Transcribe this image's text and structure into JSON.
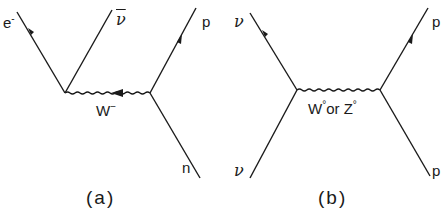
{
  "diagrams": [
    {
      "id": "a",
      "caption": "(a)",
      "particles": {
        "electron": "e",
        "electron_charge": "-",
        "antineutrino": "ν",
        "proton": "p",
        "neutron": "n"
      },
      "boson": {
        "label": "W",
        "charge": "−"
      }
    },
    {
      "id": "b",
      "caption": "(b)",
      "particles": {
        "neutrino_out": "ν",
        "neutrino_in": "ν",
        "proton_out": "p",
        "proton_in": "p"
      },
      "boson": {
        "label_w": "W",
        "sup_w": "°",
        "or": "or ",
        "label_z": "Z",
        "sup_z": "°"
      }
    }
  ],
  "colors": {
    "line": "#1a1a1a",
    "background": "#ffffff"
  }
}
